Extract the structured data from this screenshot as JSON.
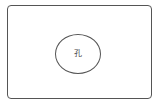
{
  "diagram": {
    "outer_shape": {
      "type": "rounded-rectangle",
      "stroke_color": "#555555"
    },
    "inner_shape": {
      "type": "ellipse",
      "label": "孔",
      "stroke_color": "#555555"
    }
  }
}
